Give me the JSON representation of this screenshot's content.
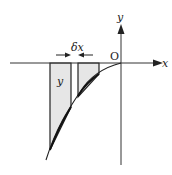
{
  "diagram": {
    "type": "area-under-curve-strips",
    "labels": {
      "x_axis": "x",
      "y_axis": "y",
      "origin": "O",
      "strip_height": "y",
      "strip_width": "δx"
    },
    "colors": {
      "axis": "#333333",
      "curve": "#222222",
      "strip_fill": "#e6e6e6",
      "strip_stroke": "#222222",
      "background": "#ffffff"
    },
    "elements": [
      "x-axis with arrow pointing right",
      "y-axis with arrow pointing up",
      "curve in third quadrant passing through origin, concave",
      "tall shaded strip labeled y",
      "shorter shaded strip with width marked δx by arrows"
    ]
  }
}
